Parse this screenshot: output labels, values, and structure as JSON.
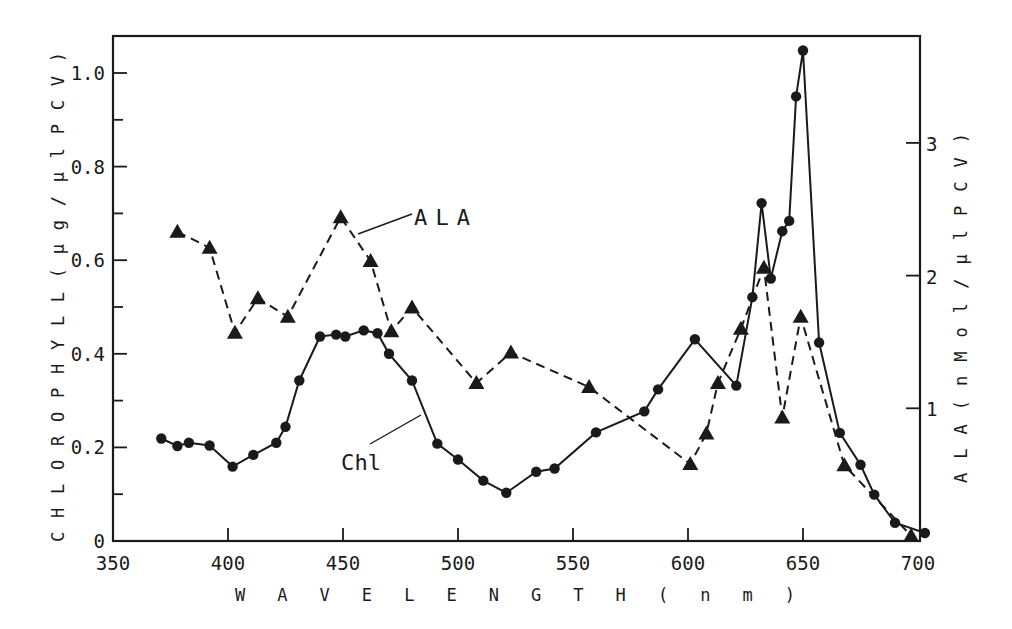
{
  "chart_data": {
    "type": "line",
    "title": "",
    "xlabel": "W A V E L E N G T H   ( n m )",
    "ylabel": "C H L O R O P H Y L L ( µ g / µ l  P C V )",
    "y2label": "A L A  ( n M o l / µ l  P C V )",
    "xlim": [
      350,
      700
    ],
    "ylim": [
      0,
      1.07
    ],
    "y2lim": [
      0,
      3.8
    ],
    "x_ticks": [
      350,
      400,
      450,
      500,
      550,
      600,
      650,
      700
    ],
    "x_tick_labels": [
      "350",
      "400",
      "450",
      "500",
      "550",
      "600",
      "650",
      "700"
    ],
    "y_ticks": [
      0,
      0.2,
      0.4,
      0.6,
      0.8,
      1.0
    ],
    "y_tick_labels": [
      "0",
      "0.2",
      "0.4",
      "0.6",
      "0.8",
      "1.0"
    ],
    "y2_ticks": [
      1,
      2,
      3
    ],
    "y2_tick_labels": [
      "1",
      "2",
      "3"
    ],
    "grid": false,
    "legend": "inline labels with leader lines",
    "series": [
      {
        "name": "Chl",
        "axis": "left",
        "marker": "circle",
        "line": "solid",
        "x": [
          371,
          378,
          383,
          392,
          402,
          411,
          421,
          425,
          431,
          440,
          447,
          451,
          459,
          465,
          470,
          480,
          491,
          500,
          511,
          521,
          534,
          542,
          560,
          581,
          587,
          603,
          621,
          628,
          632,
          636,
          641,
          644,
          647,
          650,
          657,
          666,
          675,
          681,
          690,
          703
        ],
        "values": [
          0.219,
          0.203,
          0.21,
          0.204,
          0.159,
          0.184,
          0.21,
          0.244,
          0.343,
          0.437,
          0.441,
          0.437,
          0.45,
          0.444,
          0.4,
          0.343,
          0.208,
          0.174,
          0.129,
          0.103,
          0.148,
          0.155,
          0.232,
          0.277,
          0.324,
          0.431,
          0.332,
          0.521,
          0.722,
          0.561,
          0.662,
          0.684,
          0.95,
          1.048,
          0.424,
          0.231,
          0.163,
          0.099,
          0.039,
          0.017
        ]
      },
      {
        "name": "ALA",
        "axis": "right",
        "marker": "triangle",
        "line": "dashed",
        "x": [
          378,
          392,
          403,
          413,
          426,
          449,
          462,
          471,
          480,
          508,
          523,
          557,
          601,
          608,
          613,
          623,
          633,
          641,
          649,
          668,
          697
        ],
        "values": [
          2.33,
          2.21,
          1.57,
          1.83,
          1.69,
          2.44,
          2.11,
          1.58,
          1.76,
          1.19,
          1.42,
          1.16,
          0.58,
          0.81,
          1.19,
          1.6,
          2.06,
          0.93,
          1.69,
          0.57,
          0.04
        ]
      }
    ],
    "annotations": [
      {
        "text": "ALA",
        "series": "ALA"
      },
      {
        "text": "Chl",
        "series": "Chl"
      }
    ]
  },
  "labels": {
    "ala": "ALA",
    "chl": "Chl"
  }
}
